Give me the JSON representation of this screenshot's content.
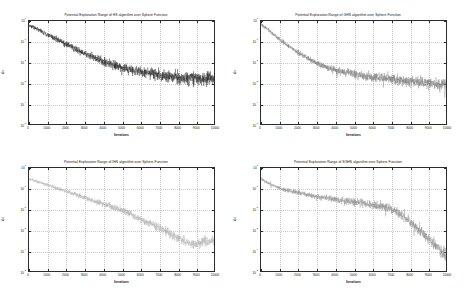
{
  "figure": {
    "background": "#ffffff",
    "layout": "2x2 grid of subplots",
    "panel_count": 4
  },
  "chart_data": [
    {
      "type": "line",
      "title": "Potential Exploration Range of HS algorithm over Sphere Function",
      "algorithm": "HS",
      "objective_function": "Sphere Function",
      "xlabel": "Iterations",
      "ylabel": "Δx",
      "xlim": [
        0,
        10000
      ],
      "xticks": [
        0,
        1000,
        2000,
        3000,
        4000,
        5000,
        6000,
        7000,
        8000,
        9000,
        10000
      ],
      "xticklabels": [
        "0",
        "1000",
        "2000",
        "3000",
        "4000",
        "5000",
        "6000",
        "7000",
        "8000",
        "9000",
        "10000"
      ],
      "yscale": "log",
      "ylim": [
        1e-05,
        1.0
      ],
      "yticks": [
        1e-05,
        0.0001,
        0.001,
        0.01,
        0.1,
        1.0
      ],
      "yticklabels": [
        "10-5",
        "10-4",
        "10-3",
        "10-2",
        "10-1",
        "100"
      ],
      "grid": true,
      "legend": null,
      "trace_color": "#1a1a1a",
      "noise_amplitude_decades": 0.3,
      "envelope_x": [
        0,
        500,
        1000,
        1500,
        2000,
        2500,
        3000,
        3500,
        4000,
        4500,
        5000,
        5500,
        6000,
        6500,
        7000,
        7500,
        8000,
        8500,
        9000,
        9500,
        10000
      ],
      "envelope_y": [
        0.62,
        0.38,
        0.22,
        0.13,
        0.075,
        0.044,
        0.026,
        0.017,
        0.011,
        0.0078,
        0.0055,
        0.0042,
        0.0034,
        0.0028,
        0.0024,
        0.0021,
        0.0019,
        0.0017,
        0.0016,
        0.00155,
        0.0015
      ]
    },
    {
      "type": "line",
      "title": "Potential Exploration Range of GHS algorithm over Sphere Function",
      "algorithm": "GHS",
      "objective_function": "Sphere Function",
      "xlabel": "Iterations",
      "ylabel": "Δx",
      "xlim": [
        0,
        10000
      ],
      "xticks": [
        0,
        1000,
        2000,
        3000,
        4000,
        5000,
        6000,
        7000,
        8000,
        9000,
        10000
      ],
      "xticklabels": [
        "0",
        "1000",
        "2000",
        "3000",
        "4000",
        "5000",
        "6000",
        "7000",
        "8000",
        "9000",
        "10000"
      ],
      "yscale": "log",
      "ylim": [
        1e-05,
        1.0
      ],
      "yticks": [
        1e-05,
        0.0001,
        0.001,
        0.01,
        0.1,
        1.0
      ],
      "yticklabels": [
        "10-5",
        "10-4",
        "10-3",
        "10-2",
        "10-1",
        "100"
      ],
      "grid": true,
      "legend": null,
      "trace_color": "#777777",
      "noise_amplitude_decades": 0.26,
      "envelope_x": [
        0,
        500,
        1000,
        1500,
        2000,
        2500,
        3000,
        3500,
        4000,
        4500,
        5000,
        5500,
        6000,
        6500,
        7000,
        7500,
        8000,
        8500,
        9000,
        9500,
        10000
      ],
      "envelope_y": [
        0.7,
        0.3,
        0.13,
        0.06,
        0.029,
        0.016,
        0.0092,
        0.006,
        0.0042,
        0.0032,
        0.0026,
        0.0022,
        0.0019,
        0.0017,
        0.0015,
        0.0013,
        0.0012,
        0.00105,
        0.00095,
        0.00085,
        0.00075
      ]
    },
    {
      "type": "line",
      "title": "Potential Exploration Range of IHS algorithm over Sphere Function",
      "algorithm": "IHS",
      "objective_function": "Sphere Function",
      "xlabel": "Iterations",
      "ylabel": "Δx",
      "xlim": [
        0,
        10000
      ],
      "xticks": [
        0,
        1000,
        2000,
        3000,
        4000,
        5000,
        6000,
        7000,
        8000,
        9000,
        10000
      ],
      "xticklabels": [
        "0",
        "1000",
        "2000",
        "3000",
        "4000",
        "5000",
        "6000",
        "7000",
        "8000",
        "9000",
        "10000"
      ],
      "yscale": "log",
      "ylim": [
        1e-05,
        1.0
      ],
      "yticks": [
        1e-05,
        0.0001,
        0.001,
        0.01,
        0.1,
        1.0
      ],
      "yticklabels": [
        "10-5",
        "10-4",
        "10-3",
        "10-2",
        "10-1",
        "100"
      ],
      "grid": true,
      "legend": null,
      "trace_color": "#b3b3b3",
      "noise_amplitude_decades": 0.22,
      "envelope_x": [
        0,
        500,
        1000,
        1500,
        2000,
        2500,
        3000,
        3500,
        4000,
        4500,
        5000,
        5500,
        6000,
        6500,
        7000,
        7500,
        8000,
        8500,
        9000,
        9500,
        10000
      ],
      "envelope_y": [
        0.3,
        0.21,
        0.15,
        0.105,
        0.074,
        0.052,
        0.037,
        0.026,
        0.018,
        0.013,
        0.0088,
        0.0056,
        0.0034,
        0.0021,
        0.0013,
        0.00075,
        0.00042,
        0.00024,
        0.0002,
        0.00026,
        0.0003
      ]
    },
    {
      "type": "line",
      "title": "Potential Exploration Range of SGHS algorithm over Sphere Function",
      "algorithm": "SGHS",
      "objective_function": "Sphere Function",
      "xlabel": "Iterations",
      "ylabel": "Δx",
      "xlim": [
        0,
        10000
      ],
      "xticks": [
        0,
        1000,
        2000,
        3000,
        4000,
        5000,
        6000,
        7000,
        8000,
        9000,
        10000
      ],
      "xticklabels": [
        "0",
        "1000",
        "2000",
        "3000",
        "4000",
        "5000",
        "6000",
        "7000",
        "8000",
        "9000",
        "10000"
      ],
      "yscale": "log",
      "ylim": [
        1e-05,
        1.0
      ],
      "yticks": [
        1e-05,
        0.0001,
        0.001,
        0.01,
        0.1,
        1.0
      ],
      "yticklabels": [
        "10-5",
        "10-4",
        "10-3",
        "10-2",
        "10-1",
        "100"
      ],
      "grid": true,
      "legend": null,
      "trace_color": "#8c8c8c",
      "noise_amplitude_decades": 0.24,
      "envelope_x": [
        0,
        500,
        1000,
        1500,
        2000,
        2500,
        3000,
        3500,
        4000,
        4500,
        5000,
        5500,
        6000,
        6500,
        7000,
        7500,
        8000,
        8500,
        9000,
        9500,
        10000
      ],
      "envelope_y": [
        0.3,
        0.16,
        0.105,
        0.08,
        0.062,
        0.05,
        0.041,
        0.035,
        0.03,
        0.026,
        0.022,
        0.019,
        0.016,
        0.013,
        0.01,
        0.0058,
        0.0028,
        0.0011,
        0.0004,
        0.00016,
        6e-05
      ]
    }
  ]
}
